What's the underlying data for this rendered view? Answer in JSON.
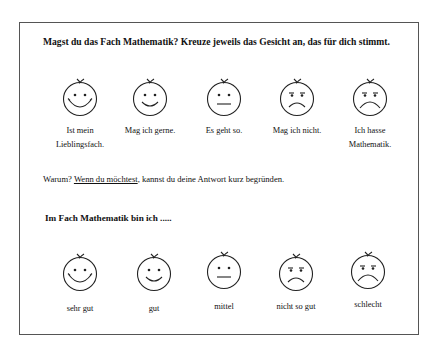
{
  "section1": {
    "title": "Magst du das Fach Mathematik? Kreuze jeweils das Gesicht an, das für dich stimmt.",
    "faces": [
      {
        "icon": "big-smile-face-icon",
        "label_line1": "Ist mein",
        "label_line2": "Lieblingsfach."
      },
      {
        "icon": "smile-face-icon",
        "label_line1": "Mag ich gerne.",
        "label_line2": ""
      },
      {
        "icon": "neutral-face-icon",
        "label_line1": "Es geht so.",
        "label_line2": ""
      },
      {
        "icon": "frown-face-icon",
        "label_line1": "Mag ich nicht.",
        "label_line2": ""
      },
      {
        "icon": "big-frown-face-icon",
        "label_line1": "Ich hasse",
        "label_line2": "Mathematik."
      }
    ]
  },
  "why": {
    "prefix": "Warum? ",
    "underlined": "Wenn du möchtest",
    "suffix": ", kannst du deine Antwort kurz begründen."
  },
  "section2": {
    "title": "Im Fach Mathematik bin ich .....",
    "faces": [
      {
        "icon": "big-smile-face-icon",
        "label": "sehr gut"
      },
      {
        "icon": "smile-face-icon",
        "label": "gut"
      },
      {
        "icon": "neutral-face-icon",
        "label": "mittel"
      },
      {
        "icon": "frown-face-icon",
        "label": "nicht so gut"
      },
      {
        "icon": "big-frown-face-icon",
        "label": "schlecht"
      }
    ]
  }
}
